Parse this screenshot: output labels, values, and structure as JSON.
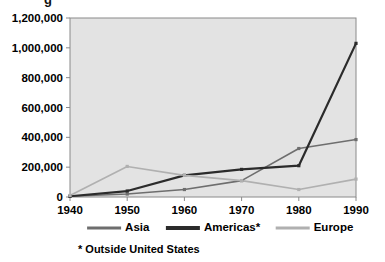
{
  "figure": {
    "title_fragment": "g",
    "footnote": "* Outside United States"
  },
  "axes": {
    "y_ticks": [
      "0",
      "200,000",
      "400,000",
      "600,000",
      "800,000",
      "1,000,000",
      "1,200,000"
    ],
    "x_ticks": [
      "1940",
      "1950",
      "1960",
      "1970",
      "1980",
      "1990"
    ]
  },
  "legend": {
    "position": "bottom",
    "items": [
      {
        "label": "Asia",
        "color": "#6e6e6e"
      },
      {
        "label": "Americas*",
        "color": "#2b2b2b"
      },
      {
        "label": "Europe",
        "color": "#b0b0b0"
      }
    ]
  },
  "colors": {
    "plot_background": "#e3e3e3",
    "plot_border": "#8a8a8a",
    "axis_text": "#000000",
    "asia": "#6e6e6e",
    "americas": "#2b2b2b",
    "europe": "#b0b0b0"
  },
  "chart_data": {
    "type": "line",
    "title": "",
    "xlabel": "",
    "ylabel": "",
    "x": [
      1940,
      1950,
      1960,
      1970,
      1980,
      1990
    ],
    "xlim": [
      1940,
      1990
    ],
    "ylim": [
      0,
      1200000
    ],
    "ytick_values": [
      0,
      200000,
      400000,
      600000,
      800000,
      1000000,
      1200000
    ],
    "grid": false,
    "legend_position": "bottom",
    "series": [
      {
        "name": "Asia",
        "color": "#6e6e6e",
        "values": [
          5000,
          20000,
          50000,
          110000,
          325000,
          385000
        ]
      },
      {
        "name": "Americas*",
        "color": "#2b2b2b",
        "values": [
          5000,
          40000,
          145000,
          185000,
          210000,
          1030000
        ]
      },
      {
        "name": "Europe",
        "color": "#b0b0b0",
        "values": [
          10000,
          205000,
          145000,
          110000,
          50000,
          120000
        ]
      }
    ],
    "annotations": [
      "* Outside United States"
    ]
  }
}
